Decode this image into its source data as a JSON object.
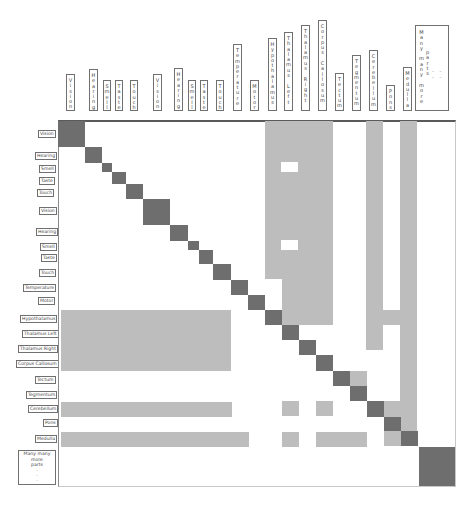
{
  "colors": {
    "dark": "#6e6e6e",
    "light": "#bdbdbd",
    "border": "#707070"
  },
  "column_labels": [
    {
      "label": "Vision",
      "x": 66,
      "y": 74,
      "w": 9,
      "h": 37
    },
    {
      "label": "Hearing",
      "x": 89,
      "y": 69,
      "w": 9,
      "h": 42
    },
    {
      "label": "Smell",
      "x": 103,
      "y": 80,
      "w": 8,
      "h": 31
    },
    {
      "label": "Taste",
      "x": 115,
      "y": 80,
      "w": 8,
      "h": 31
    },
    {
      "label": "Touch",
      "x": 130,
      "y": 80,
      "w": 8,
      "h": 31
    },
    {
      "label": "Vision",
      "x": 153,
      "y": 74,
      "w": 9,
      "h": 37
    },
    {
      "label": "Hearing",
      "x": 174,
      "y": 68,
      "w": 9,
      "h": 43
    },
    {
      "label": "Smell",
      "x": 188,
      "y": 80,
      "w": 8,
      "h": 31
    },
    {
      "label": "Taste",
      "x": 200,
      "y": 80,
      "w": 8,
      "h": 31
    },
    {
      "label": "Touch",
      "x": 216,
      "y": 80,
      "w": 8,
      "h": 31
    },
    {
      "label": "Temperature",
      "x": 233,
      "y": 44,
      "w": 9,
      "h": 67
    },
    {
      "label": "Motor",
      "x": 250,
      "y": 80,
      "w": 9,
      "h": 31
    },
    {
      "label": "Hypothalamus",
      "x": 268,
      "y": 38,
      "w": 9,
      "h": 73
    },
    {
      "label": "Thalamus Left",
      "x": 284,
      "y": 32,
      "w": 9,
      "h": 79
    },
    {
      "label": "Thalamus Right",
      "x": 301,
      "y": 25,
      "w": 9,
      "h": 86
    },
    {
      "label": "Corpus Callosum",
      "x": 318,
      "y": 20,
      "w": 9,
      "h": 91
    },
    {
      "label": "Tectum",
      "x": 335,
      "y": 73,
      "w": 9,
      "h": 38
    },
    {
      "label": "Tegmentum",
      "x": 352,
      "y": 55,
      "w": 9,
      "h": 56
    },
    {
      "label": "Cerebellum",
      "x": 369,
      "y": 50,
      "w": 9,
      "h": 61
    },
    {
      "label": "Pons",
      "x": 386,
      "y": 85,
      "w": 9,
      "h": 26
    },
    {
      "label": "Medulla",
      "x": 403,
      "y": 67,
      "w": 9,
      "h": 44
    }
  ],
  "many_column_label": {
    "line1": "Many many more",
    "line2": "parts",
    "dots": "- - - -",
    "x": 415,
    "y": 25,
    "w": 34,
    "h": 86
  },
  "row_labels": [
    {
      "label": "Vision",
      "x": 38,
      "y": 130,
      "w": 16
    },
    {
      "label": "Hearing",
      "x": 35,
      "y": 152,
      "w": 19
    },
    {
      "label": "Smell",
      "x": 39,
      "y": 165,
      "w": 14
    },
    {
      "label": "Taste",
      "x": 39,
      "y": 177,
      "w": 14
    },
    {
      "label": "Touch",
      "x": 37,
      "y": 189,
      "w": 16
    },
    {
      "label": "Vision",
      "x": 39,
      "y": 207,
      "w": 16
    },
    {
      "label": "Hearing",
      "x": 36,
      "y": 228,
      "w": 19
    },
    {
      "label": "Smell",
      "x": 40,
      "y": 243,
      "w": 14
    },
    {
      "label": "Taste",
      "x": 41,
      "y": 254,
      "w": 14
    },
    {
      "label": "Touch",
      "x": 39,
      "y": 269,
      "w": 16
    },
    {
      "label": "Temperature",
      "x": 23,
      "y": 284,
      "w": 29
    },
    {
      "label": "Motor",
      "x": 38,
      "y": 297,
      "w": 15
    },
    {
      "label": "Hypothalamus",
      "x": 20,
      "y": 315,
      "w": 33
    },
    {
      "label": "Thalamus Left",
      "x": 22,
      "y": 330,
      "w": 31
    },
    {
      "label": "Thalamus Right",
      "x": 18,
      "y": 345,
      "w": 35
    },
    {
      "label": "Corpus Callosum",
      "x": 16,
      "y": 360,
      "w": 38
    },
    {
      "label": "Tectum",
      "x": 35,
      "y": 376,
      "w": 19
    },
    {
      "label": "Tegmentum",
      "x": 26,
      "y": 391,
      "w": 27
    },
    {
      "label": "Cerebellum",
      "x": 28,
      "y": 405,
      "w": 26
    },
    {
      "label": "Pons",
      "x": 43,
      "y": 419,
      "w": 11
    },
    {
      "label": "Medulla",
      "x": 35,
      "y": 435,
      "w": 19
    }
  ],
  "many_row_label": {
    "line1": "Many many more",
    "line2": "parts",
    "dots": [
      "·",
      "·",
      "·"
    ],
    "x": 18,
    "y": 450,
    "w": 38,
    "h": 35
  },
  "matrix": {
    "frame": {
      "x": 58,
      "y": 120,
      "w": 398,
      "h": 367
    },
    "diagonal_blocks": [
      {
        "name": "Vision",
        "x": 58,
        "y": 121,
        "w": 27,
        "h": 26
      },
      {
        "name": "Hearing",
        "x": 85,
        "y": 147,
        "w": 17,
        "h": 16
      },
      {
        "name": "Smell",
        "x": 102,
        "y": 163,
        "w": 10,
        "h": 9
      },
      {
        "name": "Taste",
        "x": 112,
        "y": 172,
        "w": 14,
        "h": 12
      },
      {
        "name": "Touch",
        "x": 126,
        "y": 184,
        "w": 17,
        "h": 15
      },
      {
        "name": "Vision",
        "x": 143,
        "y": 199,
        "w": 27,
        "h": 26
      },
      {
        "name": "Hearing",
        "x": 170,
        "y": 225,
        "w": 18,
        "h": 16
      },
      {
        "name": "Smell",
        "x": 188,
        "y": 241,
        "w": 11,
        "h": 9
      },
      {
        "name": "Taste",
        "x": 199,
        "y": 250,
        "w": 14,
        "h": 14
      },
      {
        "name": "Touch",
        "x": 213,
        "y": 264,
        "w": 18,
        "h": 16
      },
      {
        "name": "Temperature",
        "x": 231,
        "y": 280,
        "w": 17,
        "h": 15
      },
      {
        "name": "Motor",
        "x": 248,
        "y": 295,
        "w": 17,
        "h": 15
      },
      {
        "name": "Hypothalamus",
        "x": 265,
        "y": 310,
        "w": 17,
        "h": 15
      },
      {
        "name": "Thalamus Left",
        "x": 282,
        "y": 325,
        "w": 17,
        "h": 15
      },
      {
        "name": "Thalamus Right",
        "x": 299,
        "y": 340,
        "w": 17,
        "h": 15
      },
      {
        "name": "Corpus Callosum",
        "x": 316,
        "y": 355,
        "w": 17,
        "h": 16
      },
      {
        "name": "Tectum",
        "x": 333,
        "y": 371,
        "w": 17,
        "h": 15
      },
      {
        "name": "Tegmentum",
        "x": 350,
        "y": 386,
        "w": 17,
        "h": 15
      },
      {
        "name": "Cerebellum",
        "x": 367,
        "y": 401,
        "w": 17,
        "h": 16
      },
      {
        "name": "Pons",
        "x": 384,
        "y": 417,
        "w": 17,
        "h": 14
      },
      {
        "name": "Medulla",
        "x": 401,
        "y": 431,
        "w": 17,
        "h": 15
      },
      {
        "name": "Many many more parts",
        "x": 419,
        "y": 447,
        "w": 36,
        "h": 39
      }
    ],
    "light_regions": [
      {
        "x": 265,
        "y": 121,
        "w": 17,
        "h": 158
      },
      {
        "x": 282,
        "y": 121,
        "w": 51,
        "h": 204
      },
      {
        "x": 366,
        "y": 121,
        "w": 17,
        "h": 229
      },
      {
        "x": 400,
        "y": 121,
        "w": 17,
        "h": 310
      },
      {
        "x": 383,
        "y": 310,
        "w": 17,
        "h": 15
      },
      {
        "x": 61,
        "y": 310,
        "w": 170,
        "h": 61
      },
      {
        "x": 350,
        "y": 371,
        "w": 17,
        "h": 15
      },
      {
        "x": 61,
        "y": 402,
        "w": 171,
        "h": 15
      },
      {
        "x": 282,
        "y": 401,
        "w": 17,
        "h": 15
      },
      {
        "x": 316,
        "y": 401,
        "w": 17,
        "h": 15
      },
      {
        "x": 384,
        "y": 401,
        "w": 16,
        "h": 16
      },
      {
        "x": 61,
        "y": 432,
        "w": 188,
        "h": 15
      },
      {
        "x": 282,
        "y": 432,
        "w": 17,
        "h": 15
      },
      {
        "x": 316,
        "y": 432,
        "w": 51,
        "h": 15
      },
      {
        "x": 384,
        "y": 431,
        "w": 17,
        "h": 15
      }
    ],
    "white_holes": [
      {
        "x": 281,
        "y": 162,
        "w": 17,
        "h": 10
      },
      {
        "x": 281,
        "y": 240,
        "w": 17,
        "h": 10
      }
    ]
  }
}
